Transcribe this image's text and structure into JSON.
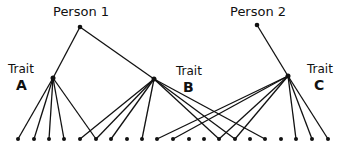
{
  "persons": [
    {
      "label": "Person 1",
      "x": 80,
      "y": 27
    },
    {
      "label": "Person 2",
      "x": 257,
      "y": 25
    }
  ],
  "traits": [
    {
      "word": "Trait",
      "letter": "A",
      "x": 53,
      "y": 78
    },
    {
      "word": "Trait",
      "letter": "B",
      "x": 154,
      "y": 79
    },
    {
      "word": "Trait",
      "letter": "C",
      "x": 288,
      "y": 76
    }
  ],
  "person_links": [
    {
      "from": 0,
      "to": 0
    },
    {
      "from": 0,
      "to": 1
    },
    {
      "from": 1,
      "to": 2
    }
  ],
  "items": {
    "y": 139,
    "x": [
      18,
      34,
      49,
      64,
      80,
      96,
      111,
      127,
      142,
      157,
      173,
      189,
      204,
      219,
      235,
      250,
      265,
      281,
      296,
      312,
      328
    ]
  },
  "trait_links": {
    "A": [
      0,
      1,
      2,
      3,
      5
    ],
    "B": [
      4,
      5,
      6,
      8,
      13,
      14,
      16
    ],
    "C": [
      9,
      10,
      13,
      14,
      18,
      19,
      20
    ]
  },
  "colors": {
    "ink": "#111111",
    "background": "#ffffff"
  }
}
